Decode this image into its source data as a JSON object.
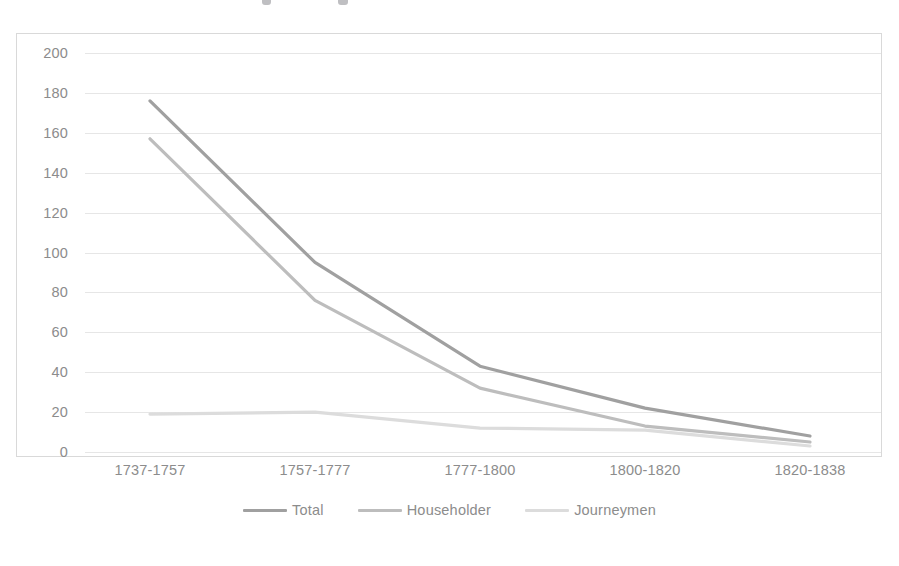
{
  "chart_data": {
    "type": "line",
    "title": "",
    "xlabel": "",
    "ylabel": "",
    "categories": [
      "1737-1757",
      "1757-1777",
      "1777-1800",
      "1800-1820",
      "1820-1838"
    ],
    "series": [
      {
        "name": "Total",
        "values": [
          176,
          95,
          43,
          22,
          8
        ],
        "color": "#a0a0a0"
      },
      {
        "name": "Householder",
        "values": [
          157,
          76,
          32,
          13,
          5
        ],
        "color": "#bdbdbd"
      },
      {
        "name": "Journeymen",
        "values": [
          19,
          20,
          12,
          11,
          3
        ],
        "color": "#dcdcdc"
      }
    ],
    "ylim": [
      0,
      200
    ],
    "ytick_step": 20,
    "yticks": [
      "200",
      "180",
      "160",
      "140",
      "120",
      "100",
      "80",
      "60",
      "40",
      "20",
      "0"
    ],
    "grid": true,
    "grid_color": "#e6e6e6",
    "legend_position": "bottom",
    "axis_text_color": "#8c8c8c",
    "plot_border_color": "#d9d9d9",
    "background": "#ffffff"
  },
  "legend": {
    "entries": [
      {
        "label": "Total"
      },
      {
        "label": "Householder"
      },
      {
        "label": "Journeymen"
      }
    ]
  }
}
